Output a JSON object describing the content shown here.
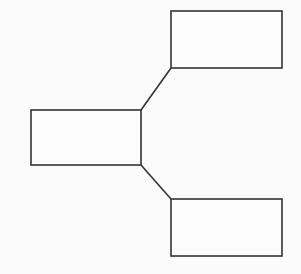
{
  "canvas": {
    "width": 301,
    "height": 274,
    "background_color": "#fbfbfb",
    "line_color": "#333333",
    "node_fill_color": "#fcfcfc"
  },
  "diagram": {
    "type": "tree-fork",
    "orientation": "left-to-right",
    "root_id": "root",
    "nodes": [
      {
        "id": "root",
        "role": "root",
        "label": "",
        "x": 31,
        "y": 110,
        "width": 110,
        "height": 55
      },
      {
        "id": "branch-top",
        "role": "child",
        "label": "",
        "x": 171,
        "y": 11,
        "width": 111,
        "height": 57
      },
      {
        "id": "branch-bottom",
        "role": "child",
        "label": "",
        "x": 171,
        "y": 199,
        "width": 111,
        "height": 57
      }
    ],
    "connectors": [
      {
        "id": "root-to-branch-top",
        "from": "root",
        "to": "branch-top",
        "x1": 141,
        "y1": 110,
        "x2": 171,
        "y2": 68
      },
      {
        "id": "root-to-branch-bottom",
        "from": "root",
        "to": "branch-bottom",
        "x1": 141,
        "y1": 165,
        "x2": 171,
        "y2": 199
      }
    ]
  },
  "watermark": {
    "text": ""
  }
}
